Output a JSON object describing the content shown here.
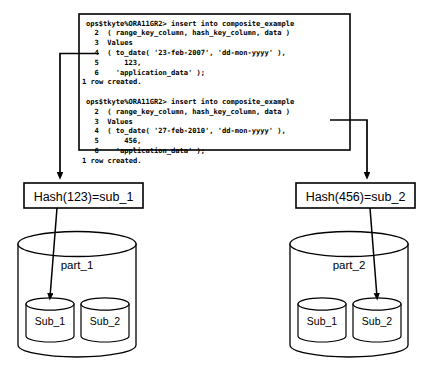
{
  "diagram": {
    "type": "flow-diagram"
  },
  "code_block": {
    "name": "sql-console-output",
    "lines": [
      "ops$tkyte%ORA11GR2> insert into composite_example",
      "  2  ( range_key_column, hash_key_column, data )",
      "  3  Values",
      "  4  ( to_date( '23-feb-2007', 'dd-mon-yyyy' ),",
      "  5      123,",
      "  6    'application_data' );",
      "1 row created.",
      "",
      "ops$tkyte%ORA11GR2> insert into composite_example",
      "  2  ( range_key_column, hash_key_column, data )",
      "  3  Values",
      "  4  ( to_date( '27-feb-2010', 'dd-mon-yyyy' ),",
      "  5      456,",
      "  6    'application_data' );",
      "1 row created."
    ]
  },
  "hash_boxes": [
    {
      "id": "hash-left",
      "label": "Hash(123)=sub_1"
    },
    {
      "id": "hash-right",
      "label": "Hash(456)=sub_2"
    }
  ],
  "partitions": [
    {
      "id": "part-left",
      "label": "part_1",
      "subpartitions": [
        {
          "id": "part1-sub1",
          "label": "Sub_1",
          "targeted": true
        },
        {
          "id": "part1-sub2",
          "label": "Sub_2",
          "targeted": false
        }
      ]
    },
    {
      "id": "part-right",
      "label": "part_2",
      "subpartitions": [
        {
          "id": "part2-sub1",
          "label": "Sub_1",
          "targeted": false
        },
        {
          "id": "part2-sub2",
          "label": "Sub_2",
          "targeted": true
        }
      ]
    }
  ],
  "colors": {
    "stroke": "#000000",
    "fill": "#ffffff",
    "text": "#000000"
  }
}
